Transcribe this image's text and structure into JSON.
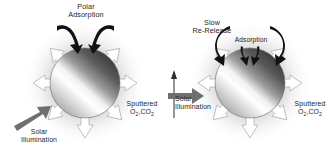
{
  "figure": {
    "type": "diagram",
    "background_color": "#ffffff",
    "panel_count": 2
  },
  "colors": {
    "sphere_dark": "#3a3a3a",
    "sphere_light": "#ffffff",
    "halo": "#d8d8d8",
    "arrow_outline": "#b4b4b4",
    "arrow_fill": "#ffffff",
    "solar_arrow": "#6f6f6f",
    "black_arrow": "#111111",
    "text": "#252525"
  },
  "panels": [
    {
      "id": "left-panel",
      "name": "polar-adsorption-panel",
      "sphere": {
        "cx": 85,
        "cy": 83,
        "r": 35,
        "gradient": "diagonal-light-left"
      },
      "labels": {
        "top": {
          "line1": "Polar",
          "line2": "Adsorption"
        },
        "solar": {
          "line1": "Solar",
          "line2": "Illumination"
        },
        "sputtered": {
          "line1": "Sputtered",
          "line2_main": "O",
          "line2_sub1": "2",
          "line2_mid": ",CO",
          "line2_sub2": "2"
        }
      },
      "black_arrows": [
        {
          "name": "polar-adsorption-arrow-left",
          "direction": "curving-down-right-onto-north-pole"
        },
        {
          "name": "polar-adsorption-arrow-right",
          "direction": "curving-down-left-onto-north-pole"
        }
      ],
      "solar_arrow": {
        "name": "solar-illumination-arrow",
        "direction": "up-right",
        "color": "#6f6f6f"
      },
      "emission_arrows": 7
    },
    {
      "id": "right-panel",
      "name": "slow-re-release-panel",
      "sphere": {
        "cx": 250,
        "cy": 83,
        "r": 35,
        "gradient": "diagonal-light-left"
      },
      "labels": {
        "top_left": {
          "line1": "Slow",
          "line2": "Re-Release"
        },
        "adsorption": "Adsorption",
        "solar": {
          "line1": "Solar",
          "line2": "Illumination"
        },
        "sputtered": {
          "line1": "Sputtered",
          "line2_main": "O",
          "line2_sub1": "2",
          "line2_mid": ",CO",
          "line2_sub2": "2"
        }
      },
      "black_arrows": [
        {
          "name": "recirculation-arrow-left",
          "direction": "counter-clockwise-loop"
        },
        {
          "name": "recirculation-arrow-right",
          "direction": "clockwise-loop"
        }
      ],
      "solar_arrow": {
        "name": "solar-illumination-arrow",
        "direction": "right",
        "color": "#6f6f6f"
      },
      "rotation_axis_arrow": {
        "name": "rotation-axis-arrow",
        "direction": "up"
      },
      "emission_arrows": 7
    }
  ]
}
